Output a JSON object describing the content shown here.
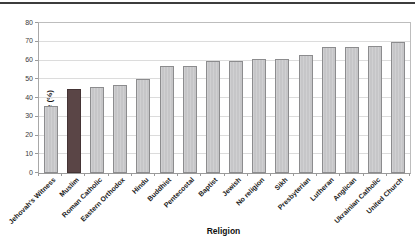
{
  "figure": {
    "top_rule_color": "#3c3c3c",
    "background": "#ffffff"
  },
  "chart_data": {
    "type": "bar",
    "title": "",
    "xlabel": "Religion",
    "ylabel": "Response (%)",
    "ylim": [
      0,
      80
    ],
    "yticks": [
      0,
      10,
      20,
      30,
      40,
      50,
      60,
      70,
      80
    ],
    "grid": true,
    "legend": "none",
    "categories": [
      "Jehovah's Witness",
      "Muslim",
      "Roman Catholic",
      "Eastern Orthodox",
      "Hindu",
      "Buddhist",
      "Pentecostal",
      "Baptist",
      "Jewish",
      "No religion",
      "Sikh",
      "Presbyterian",
      "Lutheran",
      "Anglican",
      "Ukrainian Catholic",
      "United Church"
    ],
    "values": [
      36,
      45,
      46,
      47,
      50,
      57,
      57,
      60,
      60,
      61,
      61,
      63,
      67,
      67,
      68,
      70
    ],
    "highlight_category": "Muslim",
    "colors": {
      "bar_fill": "#c6c6c8",
      "bar_border": "#8c8c8e",
      "highlight_fill": "#5a4546",
      "highlight_border": "#443435",
      "gridline": "#dcdcdc",
      "axis": "#9a9a9a",
      "text": "#1c1c1c"
    }
  }
}
